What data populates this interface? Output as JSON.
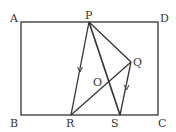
{
  "diagram": {
    "type": "geometry",
    "rectangle": [
      "A",
      "B",
      "C",
      "D"
    ],
    "labels": {
      "A": "A",
      "B": "B",
      "C": "C",
      "D": "D",
      "P": "P",
      "Q": "Q",
      "O": "O",
      "R": "R",
      "S": "S"
    },
    "segments": [
      "PR",
      "PS",
      "PQ",
      "QR",
      "QS"
    ],
    "parallel_marks": [
      "PR",
      "QS"
    ],
    "colors": {
      "stroke": "#333333",
      "background": "#ffffff"
    }
  }
}
